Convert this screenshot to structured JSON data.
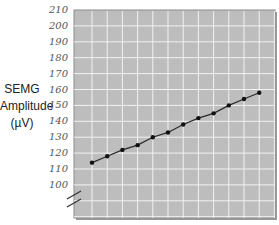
{
  "chart_data": {
    "type": "line",
    "title": "",
    "xlabel": "",
    "ylabel": "SEMG Amplitude (µV)",
    "ylabel_lines": [
      "SEMG",
      "Amplitude",
      "(µV)"
    ],
    "y_ticks": [
      210,
      200,
      190,
      180,
      170,
      160,
      150,
      140,
      130,
      120,
      110,
      100
    ],
    "ylim": [
      95,
      210
    ],
    "axis_break": true,
    "grid": true,
    "x": [
      1,
      2,
      3,
      4,
      5,
      6,
      7,
      8,
      9,
      10,
      11,
      12
    ],
    "series": [
      {
        "name": "SEMG Amplitude",
        "values": [
          114,
          118,
          122,
          125,
          130,
          133,
          138,
          142,
          145,
          150,
          154,
          158
        ]
      }
    ],
    "colors": {
      "plot_bg": "#bdbdbd",
      "grid": "#f2f2f2",
      "line": "#2a2a2a",
      "marker": "#111111"
    }
  }
}
